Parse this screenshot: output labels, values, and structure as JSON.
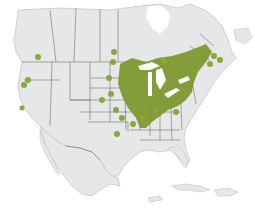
{
  "map": {
    "type": "range-map",
    "region": "North America",
    "colors": {
      "background": "#ffffff",
      "land": "#e6e7e9",
      "borders": "#6d6e71",
      "range": "#7d9a2e",
      "range_dots": "#8aa73a",
      "lakes": "#ffffff"
    },
    "labels": []
  }
}
